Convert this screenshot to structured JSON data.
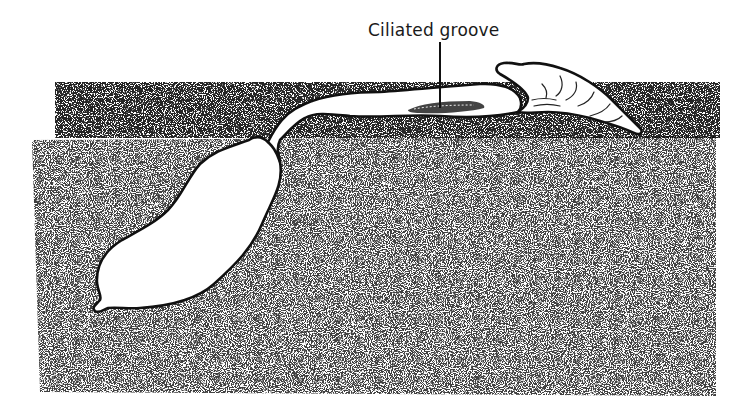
{
  "figure": {
    "labels": [
      {
        "id": "ciliated-groove",
        "text": "Ciliated groove",
        "x": 368,
        "y": 20
      }
    ],
    "colors": {
      "ink": "#111111",
      "stipple": "#3a3a3a",
      "background": "#ffffff"
    },
    "regions": {
      "surface_scatter": {
        "x": 50,
        "y": 80,
        "width": 670,
        "height": 60
      },
      "sediment": {
        "x": 32,
        "y": 137,
        "width": 683,
        "height": 260
      }
    }
  }
}
